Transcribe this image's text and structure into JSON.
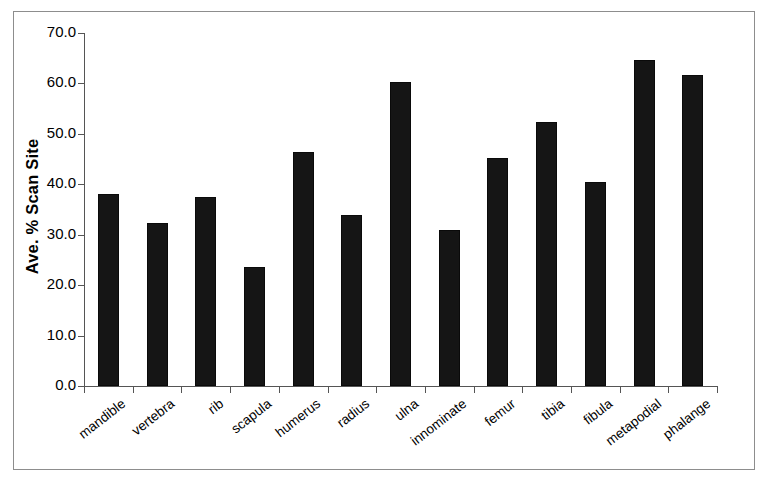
{
  "chart_data": {
    "type": "bar",
    "title": "",
    "xlabel": "",
    "ylabel": "Ave. % Scan Site",
    "ylim": [
      0.0,
      70.0
    ],
    "y_tick_labels": [
      "70.0",
      "60.0",
      "50.0",
      "40.0",
      "30.0",
      "20.0",
      "10.0",
      "0.0"
    ],
    "y_tick_values": [
      70.0,
      60.0,
      50.0,
      40.0,
      30.0,
      20.0,
      10.0,
      0.0
    ],
    "grid": false,
    "legend": false,
    "bar_color": "#151515",
    "categories": [
      "mandible",
      "vertebra",
      "rib",
      "scapula",
      "humerus",
      "radius",
      "ulna",
      "innominate",
      "femur",
      "tibia",
      "fibula",
      "metapodial",
      "phalange"
    ],
    "values": [
      38.0,
      32.4,
      37.4,
      23.6,
      46.5,
      33.9,
      60.3,
      31.0,
      45.2,
      52.3,
      40.5,
      64.7,
      61.7
    ]
  }
}
